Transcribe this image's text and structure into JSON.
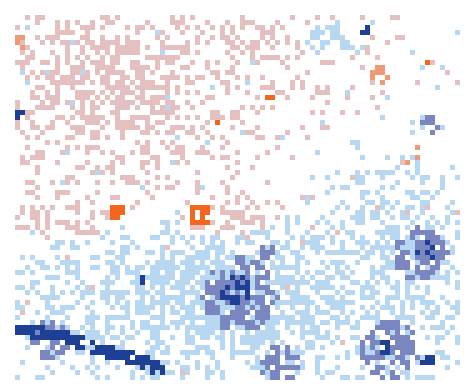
{
  "map": {
    "width": 470,
    "height": 388,
    "grid": {
      "x0": 15,
      "y0": 15,
      "x1": 456,
      "y1": 376,
      "cell": 5
    },
    "background": "#ffffff",
    "palette": {
      "red_light": "#e4c0c0",
      "red_mid": "#ef9a74",
      "red_strong": "#f4661e",
      "blue_light": "#b8d8f2",
      "blue_mid": "#7a86bf",
      "blue_strong": "#1d3f95"
    },
    "seed": 7,
    "hotspots": [
      {
        "kind": "red",
        "x": 120,
        "y": 90,
        "rx": 130,
        "ry": 85,
        "w": 0.55
      },
      {
        "kind": "red",
        "x": 260,
        "y": 40,
        "rx": 80,
        "ry": 30,
        "w": 0.45
      },
      {
        "kind": "red",
        "x": 60,
        "y": 210,
        "rx": 70,
        "ry": 30,
        "w": 0.45
      },
      {
        "kind": "red",
        "x": 230,
        "y": 220,
        "rx": 60,
        "ry": 30,
        "w": 0.4
      },
      {
        "kind": "red",
        "x": 330,
        "y": 60,
        "rx": 60,
        "ry": 60,
        "w": 0.2
      },
      {
        "kind": "blue",
        "x": 240,
        "y": 300,
        "rx": 210,
        "ry": 70,
        "w": 0.75
      },
      {
        "kind": "blue",
        "x": 390,
        "y": 280,
        "rx": 70,
        "ry": 110,
        "w": 0.6
      },
      {
        "kind": "blue",
        "x": 120,
        "y": 330,
        "rx": 110,
        "ry": 50,
        "w": 0.6
      },
      {
        "kind": "blue",
        "x": 320,
        "y": 40,
        "rx": 40,
        "ry": 20,
        "w": 0.45
      }
    ],
    "strong_cells": [
      {
        "kind": "red_strong",
        "x": 200,
        "y": 215,
        "r": 11
      },
      {
        "kind": "red_strong",
        "x": 118,
        "y": 213,
        "r": 9
      },
      {
        "kind": "red_strong",
        "x": 270,
        "y": 97,
        "r": 5
      },
      {
        "kind": "red_strong",
        "x": 218,
        "y": 120,
        "r": 5
      },
      {
        "kind": "red_strong",
        "x": 427,
        "y": 62,
        "r": 5
      },
      {
        "kind": "red_mid",
        "x": 22,
        "y": 45,
        "r": 10
      },
      {
        "kind": "red_mid",
        "x": 412,
        "y": 155,
        "r": 10
      },
      {
        "kind": "red_mid",
        "x": 380,
        "y": 75,
        "r": 8
      },
      {
        "kind": "blue_strong",
        "x": 235,
        "y": 290,
        "r": 16
      },
      {
        "kind": "blue_mid",
        "x": 240,
        "y": 295,
        "r": 38
      },
      {
        "kind": "blue_strong",
        "x": 425,
        "y": 250,
        "r": 12
      },
      {
        "kind": "blue_mid",
        "x": 420,
        "y": 255,
        "r": 28
      },
      {
        "kind": "blue_strong",
        "x": 365,
        "y": 30,
        "r": 5
      },
      {
        "kind": "blue_mid",
        "x": 430,
        "y": 125,
        "r": 10
      },
      {
        "kind": "blue_mid",
        "x": 390,
        "y": 350,
        "r": 30
      },
      {
        "kind": "blue_strong",
        "x": 385,
        "y": 348,
        "r": 7
      },
      {
        "kind": "blue_strong",
        "x": 427,
        "y": 360,
        "r": 7
      },
      {
        "kind": "blue_mid",
        "x": 280,
        "y": 365,
        "r": 20
      },
      {
        "kind": "blue_mid",
        "x": 270,
        "y": 250,
        "r": 12
      },
      {
        "kind": "blue_strong",
        "x": 145,
        "y": 280,
        "r": 5
      },
      {
        "kind": "blue_strong",
        "x": 20,
        "y": 115,
        "r": 4
      },
      {
        "kind": "blue_mid",
        "x": 50,
        "y": 340,
        "r": 20
      }
    ],
    "bands": [
      {
        "kind": "blue_strong",
        "points": [
          [
            15,
            330
          ],
          [
            60,
            335
          ],
          [
            100,
            350
          ],
          [
            140,
            360
          ],
          [
            160,
            370
          ]
        ],
        "thick": 12
      }
    ]
  }
}
